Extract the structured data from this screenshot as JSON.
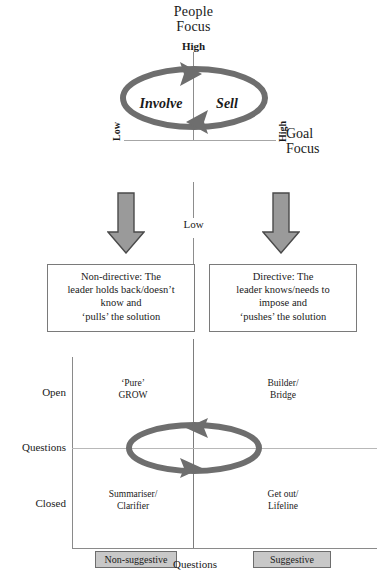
{
  "diagram": {
    "top_model": {
      "y_axis_title": "People\nFocus",
      "y_axis_title_line1": "People",
      "y_axis_title_line2": "Focus",
      "y_high_label": "High",
      "y_low_label": "Low",
      "x_axis_title_line1": "Goal",
      "x_axis_title_line2": "Focus",
      "x_low_label": "Low",
      "x_high_label": "High",
      "cycle_labels": [
        "Involve",
        "Sell"
      ],
      "cycle_direction": "clockwise"
    },
    "descriptions": [
      {
        "side": "left",
        "lines": [
          "Non-directive: The",
          "leader holds back/doesn’t",
          "know and",
          "‘pulls’ the solution"
        ]
      },
      {
        "side": "right",
        "lines": [
          "Directive: The",
          "leader knows/needs to",
          "impose and",
          "‘pushes’ the solution"
        ]
      }
    ],
    "arrows": [
      {
        "name": "left-down-arrow",
        "direction": "down"
      },
      {
        "name": "right-down-arrow",
        "direction": "down"
      }
    ],
    "bottom_model": {
      "y_axis_ticks": [
        "Open",
        "Questions",
        "Closed"
      ],
      "x_axis_caption": "Questions",
      "x_axis_badges": [
        "Non-suggestive",
        "Suggestive"
      ],
      "cycle_direction": "counter-clockwise",
      "quadrants": [
        {
          "position": "top-left",
          "line1": "‘Pure’",
          "line2": "GROW"
        },
        {
          "position": "top-right",
          "line1": "Builder/",
          "line2": "Bridge"
        },
        {
          "position": "bottom-left",
          "line1": "Summariser/",
          "line2": "Clarifier"
        },
        {
          "position": "bottom-right",
          "line1": "Get out/",
          "line2": "Lifeline"
        }
      ]
    },
    "colors": {
      "ellipse_gray": "#6e6e6e",
      "arrow_fill": "#9a9a9a",
      "arrow_stroke": "#4a4a4a",
      "badge_fill": "#c8c8c8",
      "axis_line": "#8a8a8a",
      "box_border": "#7a7a7a",
      "text": "#1a1a1a"
    }
  }
}
